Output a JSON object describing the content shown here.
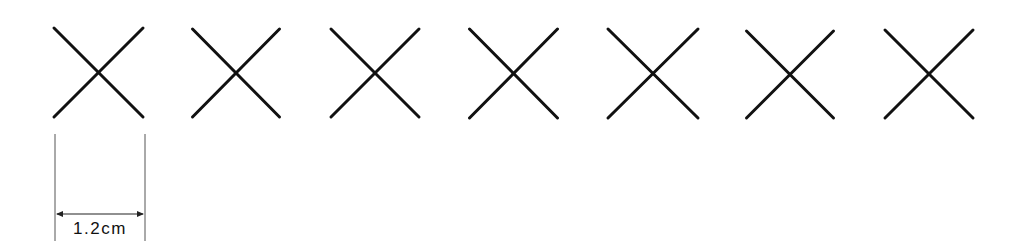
{
  "diagram": {
    "type": "cross-stitch-marks",
    "stroke_color": "#111111",
    "guide_color": "#444444",
    "background": "#ffffff",
    "marks": [
      {
        "id": 1,
        "x": 54,
        "y": 28,
        "w": 89,
        "h": 89
      },
      {
        "id": 2,
        "x": 197,
        "y": 29,
        "w": 87,
        "h": 88
      },
      {
        "id": 3,
        "x": 339,
        "y": 29,
        "w": 88,
        "h": 88
      },
      {
        "id": 4,
        "x": 481,
        "y": 29,
        "w": 88,
        "h": 89
      },
      {
        "id": 5,
        "x": 480,
        "y": 29,
        "w": 90,
        "h": 89
      },
      {
        "id": 6,
        "x": 624,
        "y": 31,
        "w": 87,
        "h": 87
      },
      {
        "id": 7,
        "x": 765,
        "y": 30,
        "w": 88,
        "h": 88
      }
    ],
    "dimension": {
      "label": "1.2cm",
      "left_x": 55,
      "right_x": 145,
      "top_y": 134,
      "bottom_y": 245,
      "arrow_y": 214
    }
  }
}
